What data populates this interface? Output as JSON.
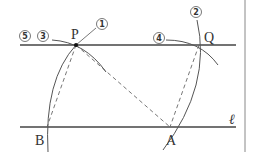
{
  "diagram": {
    "points": {
      "P": {
        "label": "P",
        "x": 76,
        "y": 45
      },
      "Q": {
        "label": "Q",
        "x": 199,
        "y": 45
      },
      "A": {
        "label": "A",
        "x": 170,
        "y": 127
      },
      "B": {
        "label": "B",
        "x": 47,
        "y": 127
      }
    },
    "line_label": "ℓ",
    "steps": [
      {
        "label": "1",
        "glyph": "①"
      },
      {
        "label": "2",
        "glyph": "②"
      },
      {
        "label": "3",
        "glyph": "③"
      },
      {
        "label": "4",
        "glyph": "④"
      },
      {
        "label": "5",
        "glyph": "⑤"
      }
    ],
    "colors": {
      "line": "#444444",
      "arc": "#555555",
      "dashed": "#666666",
      "border": "#888888"
    }
  }
}
